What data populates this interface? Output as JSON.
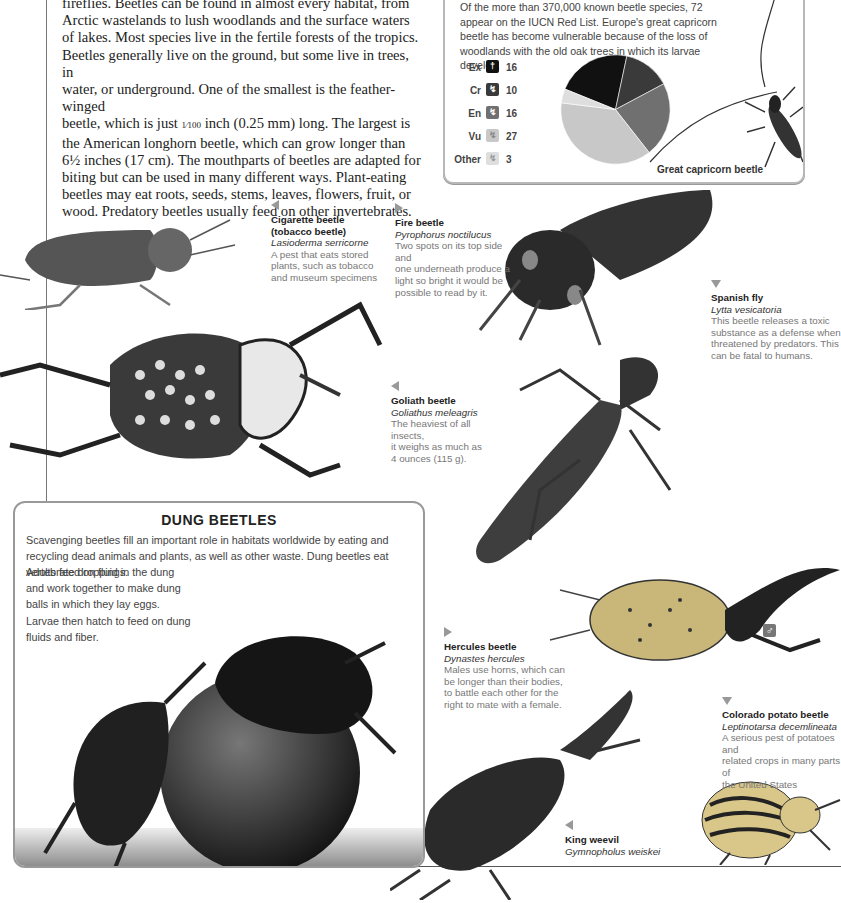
{
  "intro": {
    "lines": [
      "fireflies. Beetles can be found in almost every habitat, from",
      "Arctic wastelands to lush woodlands and the surface waters",
      "of lakes. Most species live in the fertile forests of the tropics.",
      "Beetles generally live on the ground, but some live in trees, in",
      "water, or underground. One of the smallest is the feather-winged",
      "beetle, which is just",
      "inch (0.25 mm) long. The largest is",
      "the American longhorn beetle, which can grow longer than",
      "6½ inches (17 cm). The mouthparts of beetles are adapted for",
      "biting but can be used in many different ways. Plant-eating",
      "beetles may eat roots, seeds, stems, leaves, flowers, fruit, or",
      "wood. Predatory beetles usually feed on other invertebrates."
    ],
    "fraction": "1⁄100"
  },
  "red_list": {
    "text": "Of the more than 370,000 known beetle species, 72 appear on the IUCN Red List. Europe's great capricorn beetle has become vulnerable because of the loss of woodlands with the old oak trees in which its larvae develop.",
    "caption": "Great capricorn beetle",
    "legend": [
      {
        "label": "Ex",
        "value": "16",
        "color": "#111111",
        "icon": "†"
      },
      {
        "label": "Cr",
        "value": "10",
        "color": "#3a3a3a",
        "icon": "↯"
      },
      {
        "label": "En",
        "value": "16",
        "color": "#707070",
        "icon": "↯"
      },
      {
        "label": "Vu",
        "value": "27",
        "color": "#c8c8c8",
        "icon": "↯"
      },
      {
        "label": "Other",
        "value": "3",
        "color": "#dedede",
        "icon": "↯"
      }
    ]
  },
  "chart_data": {
    "type": "pie",
    "categories": [
      "Ex",
      "Cr",
      "En",
      "Vu",
      "Other"
    ],
    "values": [
      16,
      10,
      16,
      27,
      3
    ],
    "colors": [
      "#111111",
      "#3a3a3a",
      "#707070",
      "#c8c8c8",
      "#dedede"
    ],
    "legend_position": "left"
  },
  "species": [
    {
      "name": "Cigarette beetle",
      "name2": "(tobacco beetle)",
      "sci": "Lasioderma serricorne",
      "desc": [
        "A pest that eats stored",
        "plants, such as tobacco",
        "and museum specimens"
      ]
    },
    {
      "name": "Fire beetle",
      "sci": "Pyrophorus noctilucus",
      "desc": [
        "Two spots on its top side and",
        "one underneath produce a",
        "light so bright it would be",
        "possible to read by it."
      ]
    },
    {
      "name": "Spanish fly",
      "sci": "Lytta vesicatoria",
      "desc": [
        "This beetle releases a toxic",
        "substance as a defense when",
        "threatened by predators. This",
        "can be fatal to humans."
      ]
    },
    {
      "name": "Goliath beetle",
      "sci": "Goliathus meleagris",
      "desc": [
        "The heaviest of all insects,",
        "it weighs as much as",
        "4 ounces (115 g)."
      ]
    },
    {
      "name": "Hercules beetle",
      "sci": "Dynastes hercules",
      "desc": [
        "Males use horns, which can",
        "be longer than their bodies,",
        "to battle each other for the",
        "right to mate with a female."
      ]
    },
    {
      "name": "Colorado potato beetle",
      "sci": "Leptinotarsa decemlineata",
      "desc": [
        "A serious pest of potatoes and",
        "related crops in many parts of",
        "the United States"
      ]
    },
    {
      "name": "King weevil",
      "sci": "Gymnopholus weiskei",
      "desc": []
    }
  ],
  "dung": {
    "title": "DUNG BEETLES",
    "text1": "Scavenging beetles fill an important role in habitats worldwide by eating and recycling dead animals and plants, as well as other waste. Dung beetles eat vertebrate droppings.",
    "text2": "Adults feed on fluid in the dung and work together to make dung balls in which they lay eggs. Larvae then hatch to feed on dung fluids and fiber."
  },
  "male_symbol": "♂"
}
